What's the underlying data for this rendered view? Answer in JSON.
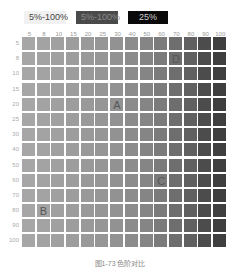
{
  "legend": [
    {
      "label": "5%-100%"
    },
    {
      "label": "5%-100%"
    },
    {
      "label": "25%"
    }
  ],
  "columns": [
    "5",
    "8",
    "10",
    "15",
    "20",
    "25",
    "30",
    "40",
    "50",
    "60",
    "70",
    "80",
    "90",
    "100"
  ],
  "rows": [
    "5",
    "8",
    "10",
    "15",
    "20",
    "25",
    "30",
    "40",
    "50",
    "60",
    "70",
    "80",
    "90",
    "100"
  ],
  "markers": [
    {
      "label": "A",
      "col": 6,
      "row": 4
    },
    {
      "label": "B",
      "col": 1,
      "row": 11
    },
    {
      "label": "C",
      "col": 9,
      "row": 9
    },
    {
      "label": "D",
      "col": 10,
      "row": 1
    }
  ],
  "caption": "图1-73  色阶对比",
  "chart_data": {
    "type": "heatmap",
    "title": "",
    "x": [
      "5",
      "8",
      "10",
      "15",
      "20",
      "25",
      "30",
      "40",
      "50",
      "60",
      "70",
      "80",
      "90",
      "100"
    ],
    "y": [
      "5",
      "8",
      "10",
      "15",
      "20",
      "25",
      "30",
      "40",
      "50",
      "60",
      "70",
      "80",
      "90",
      "100"
    ],
    "column_colors": [
      "#a6a6a6",
      "#a3a3a3",
      "#a0a0a0",
      "#9d9d9d",
      "#999999",
      "#969696",
      "#929292",
      "#8c8c8c",
      "#858585",
      "#7b7b7b",
      "#6e6e6e",
      "#606060",
      "#4c4c4c",
      "#3f3f3f"
    ],
    "legend": [
      "5%-100%",
      "5%-100%",
      "25%"
    ],
    "annotations": [
      "A",
      "B",
      "C",
      "D"
    ],
    "grid": true
  }
}
